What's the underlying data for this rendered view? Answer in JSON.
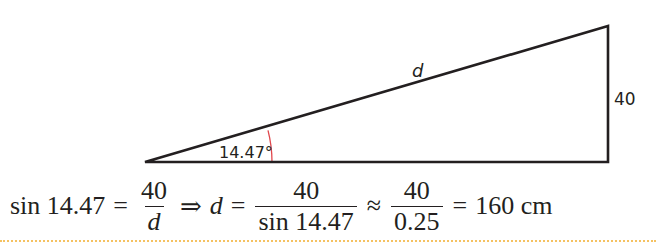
{
  "diagram": {
    "type": "right-triangle",
    "vertices": {
      "left": {
        "x": 145,
        "y": 162
      },
      "top_right": {
        "x": 608,
        "y": 26
      },
      "bottom_right": {
        "x": 608,
        "y": 162
      }
    },
    "labels": {
      "hypotenuse": "d",
      "opposite_side": "40",
      "angle": "14.47°"
    },
    "angle_arc": {
      "color": "#e0474c",
      "radius": 127
    },
    "line_color": "#231f20"
  },
  "formula": {
    "lhs_func": "sin 14.47",
    "eq1": "=",
    "frac1": {
      "num": "40",
      "den": "d"
    },
    "implies": "⇒",
    "var": "d",
    "eq2": "=",
    "frac2": {
      "num": "40",
      "den": "sin 14.47"
    },
    "approx": "≈",
    "frac3": {
      "num": "40",
      "den": "0.25"
    },
    "eq3": "=",
    "result": "160 cm"
  },
  "divider_color": "#f5c262"
}
